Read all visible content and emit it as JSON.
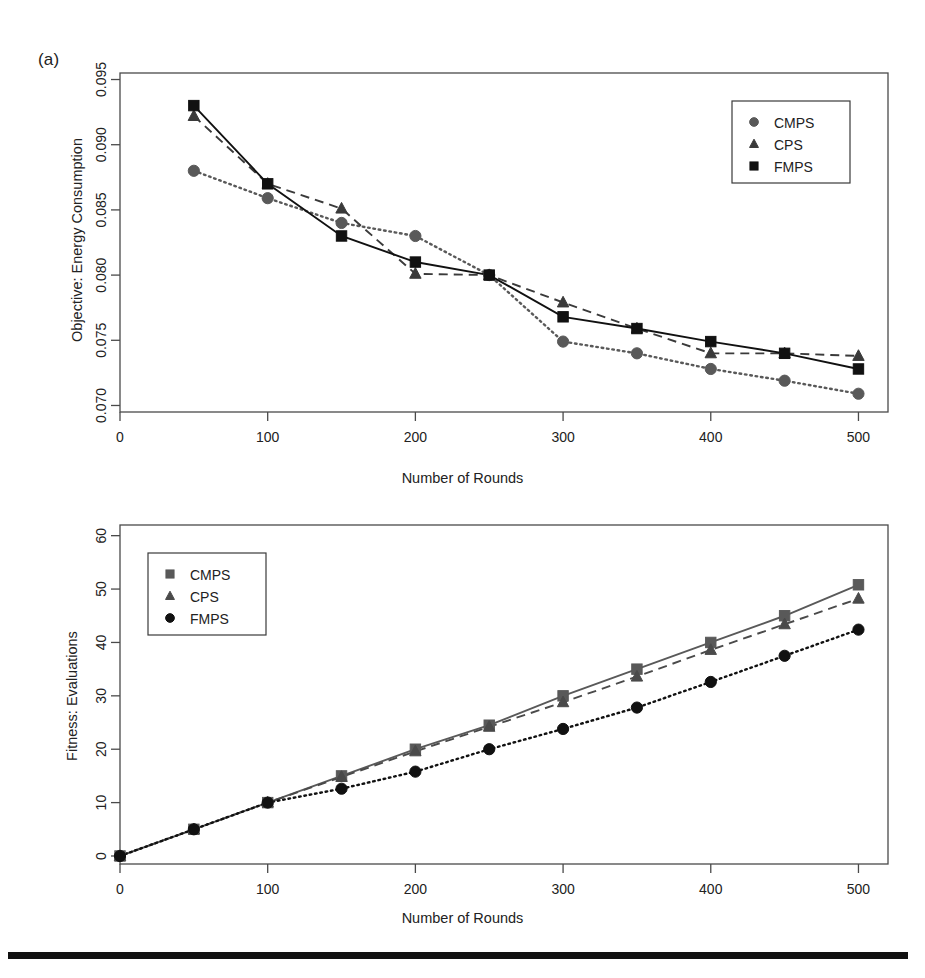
{
  "figure": {
    "panel_a_tag": "(a)",
    "bottom_rule": "solid-black-rule"
  },
  "chart_data": [
    {
      "id": "panel-a",
      "type": "line",
      "title": "",
      "panel_label": "(a)",
      "xlabel": "Number of Rounds",
      "ylabel": "Objective: Energy Consumption",
      "xlim": [
        0,
        520
      ],
      "ylim": [
        0.0695,
        0.0955
      ],
      "xticks": [
        0,
        100,
        200,
        300,
        400,
        500
      ],
      "xticklabels": [
        "0",
        "100",
        "200",
        "300",
        "400",
        "500"
      ],
      "yticks": [
        0.07,
        0.075,
        0.08,
        0.085,
        0.09,
        0.095
      ],
      "yticklabels": [
        "0.070",
        "0.075",
        "0.080",
        "0.085",
        "0.090",
        "0.095"
      ],
      "grid": false,
      "legend_position": "top-right",
      "x": [
        50,
        100,
        150,
        200,
        250,
        300,
        350,
        400,
        450,
        500
      ],
      "series": [
        {
          "name": "CMPS",
          "marker": "circle",
          "linestyle": "dotted",
          "color": "#595959",
          "values": [
            0.088,
            0.0859,
            0.084,
            0.083,
            0.08,
            0.0749,
            0.074,
            0.0728,
            0.0719,
            0.0709
          ]
        },
        {
          "name": "CPS",
          "marker": "triangle",
          "linestyle": "dashed",
          "color": "#3a3a3a",
          "values": [
            0.0922,
            0.087,
            0.0851,
            0.0801,
            0.08,
            0.0779,
            0.0759,
            0.074,
            0.074,
            0.0738
          ]
        },
        {
          "name": "FMPS",
          "marker": "square",
          "linestyle": "solid",
          "color": "#111111",
          "values": [
            0.093,
            0.087,
            0.083,
            0.081,
            0.08,
            0.0768,
            0.0759,
            0.0749,
            0.074,
            0.0728
          ]
        }
      ]
    },
    {
      "id": "panel-b",
      "type": "line",
      "title": "",
      "panel_label": "",
      "xlabel": "Number of Rounds",
      "ylabel": "Fitness: Evaluations",
      "xlim": [
        0,
        520
      ],
      "ylim": [
        -1.5,
        62
      ],
      "xticks": [
        0,
        100,
        200,
        300,
        400,
        500
      ],
      "xticklabels": [
        "0",
        "100",
        "200",
        "300",
        "400",
        "500"
      ],
      "yticks": [
        0,
        10,
        20,
        30,
        40,
        50,
        60
      ],
      "yticklabels": [
        "0",
        "10",
        "20",
        "30",
        "40",
        "50",
        "60"
      ],
      "grid": false,
      "legend_position": "top-left",
      "x": [
        0,
        50,
        100,
        150,
        200,
        250,
        300,
        350,
        400,
        450,
        500
      ],
      "series": [
        {
          "name": "CMPS",
          "marker": "square",
          "linestyle": "solid",
          "color": "#595959",
          "values": [
            0.0,
            5.0,
            10.0,
            15.0,
            20.0,
            24.5,
            30.0,
            35.0,
            40.0,
            45.0,
            50.8
          ]
        },
        {
          "name": "CPS",
          "marker": "triangle",
          "linestyle": "dashed",
          "color": "#4a4a4a",
          "values": [
            0.0,
            5.0,
            10.0,
            14.8,
            19.6,
            24.2,
            28.8,
            33.6,
            38.6,
            43.4,
            48.2
          ]
        },
        {
          "name": "FMPS",
          "marker": "circle",
          "linestyle": "dotted",
          "color": "#111111",
          "values": [
            0.0,
            5.0,
            10.0,
            12.6,
            15.8,
            20.0,
            23.8,
            27.8,
            32.6,
            37.5,
            42.4
          ]
        }
      ]
    }
  ]
}
